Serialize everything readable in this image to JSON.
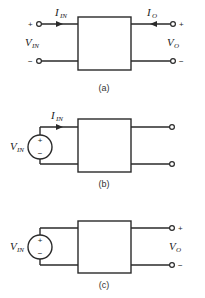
{
  "diagrams": [
    {
      "id": "a",
      "caption": "(a)",
      "input_current": {
        "main": "I",
        "sub": "IN"
      },
      "input_voltage": {
        "main": "V",
        "sub": "IN"
      },
      "output_current": {
        "main": "I",
        "sub": "O"
      },
      "output_voltage": {
        "main": "V",
        "sub": "O"
      },
      "input_plus": "+",
      "input_minus": "−",
      "output_plus": "+",
      "output_minus": "−"
    },
    {
      "id": "b",
      "caption": "(b)",
      "input_current": {
        "main": "I",
        "sub": "IN"
      },
      "source_voltage": {
        "main": "V",
        "sub": "IN"
      },
      "source_plus": "+",
      "source_minus": "−"
    },
    {
      "id": "c",
      "caption": "(c)",
      "source_voltage": {
        "main": "V",
        "sub": "IN"
      },
      "source_plus": "+",
      "source_minus": "−",
      "output_voltage": {
        "main": "V",
        "sub": "O"
      },
      "output_plus": "+",
      "output_minus": "−"
    }
  ],
  "colors": {
    "line": "#2a2a2a",
    "background": "#ffffff"
  }
}
